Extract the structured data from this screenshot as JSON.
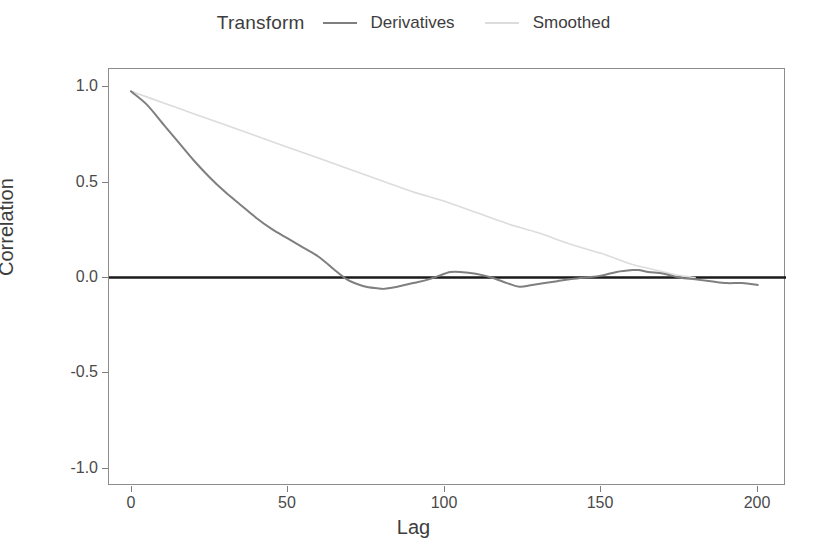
{
  "legend": {
    "title": "Transform",
    "entries": [
      {
        "label": "Derivatives",
        "color": "#7f7f7f"
      },
      {
        "label": "Smoothed",
        "color": "#dcdcdc"
      }
    ]
  },
  "axes": {
    "y_title": "Correlation",
    "x_title": "Lag",
    "y_ticks": [
      "1.0",
      "0.5",
      "0.0",
      "-0.5",
      "-1.0"
    ],
    "x_ticks": [
      "0",
      "50",
      "100",
      "150",
      "200"
    ]
  },
  "chart_data": {
    "type": "line",
    "title": "",
    "subtitle": "",
    "xlabel": "Lag",
    "ylabel": "Correlation",
    "xlim": [
      -7,
      209
    ],
    "ylim": [
      -1.12,
      1.12
    ],
    "xticks": [
      0,
      50,
      100,
      150,
      200
    ],
    "yticks": [
      -1.0,
      -0.5,
      0.0,
      0.5,
      1.0
    ],
    "grid": false,
    "legend_position": "top-center",
    "legend_title": "Transform",
    "zero_reference_line": 0.0,
    "annotations": [],
    "series": [
      {
        "name": "Derivatives",
        "color": "#7f7f7f",
        "x": [
          0,
          5,
          10,
          15,
          20,
          25,
          30,
          35,
          40,
          45,
          50,
          55,
          60,
          65,
          68,
          70,
          75,
          80,
          81,
          85,
          90,
          95,
          100,
          102,
          105,
          110,
          115,
          120,
          124,
          128,
          132,
          136,
          140,
          145,
          150,
          155,
          160,
          162,
          165,
          170,
          175,
          180,
          185,
          190,
          195,
          200
        ],
        "y": [
          1.0,
          0.93,
          0.83,
          0.73,
          0.63,
          0.54,
          0.46,
          0.39,
          0.32,
          0.26,
          0.21,
          0.16,
          0.11,
          0.04,
          0.0,
          -0.02,
          -0.05,
          -0.06,
          -0.06,
          -0.05,
          -0.03,
          -0.01,
          0.02,
          0.03,
          0.03,
          0.02,
          0.0,
          -0.03,
          -0.05,
          -0.04,
          -0.03,
          -0.02,
          -0.01,
          0.0,
          0.01,
          0.03,
          0.04,
          0.04,
          0.03,
          0.02,
          0.0,
          -0.01,
          -0.02,
          -0.03,
          -0.03,
          -0.04
        ]
      },
      {
        "name": "Smoothed",
        "color": "#dcdcdc",
        "x": [
          0,
          10,
          20,
          30,
          40,
          50,
          60,
          70,
          80,
          90,
          100,
          110,
          120,
          130,
          140,
          150,
          160,
          165,
          170,
          175,
          180
        ],
        "y": [
          1.0,
          0.94,
          0.88,
          0.82,
          0.76,
          0.7,
          0.64,
          0.58,
          0.52,
          0.46,
          0.41,
          0.35,
          0.29,
          0.24,
          0.18,
          0.13,
          0.07,
          0.05,
          0.03,
          0.01,
          0.0
        ]
      }
    ]
  }
}
